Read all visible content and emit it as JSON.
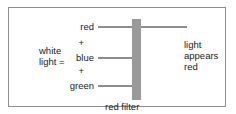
{
  "diagram": {
    "frame": {
      "border_color": "#8d8d8d",
      "background": "#ffffff"
    },
    "input": {
      "source_label_line1": "white",
      "source_label_line2": "light =",
      "components": [
        {
          "name": "red",
          "label": "red",
          "passes_filter": true
        },
        {
          "name": "blue",
          "label": "blue",
          "passes_filter": false
        },
        {
          "name": "green",
          "label": "green",
          "passes_filter": false
        }
      ],
      "separators": [
        "+",
        "+"
      ]
    },
    "filter": {
      "caption": "red filter",
      "color": "#9a9a9a"
    },
    "output": {
      "line1": "light",
      "line2": "appears",
      "line3": "red"
    },
    "ray_color": "#8d8d8d"
  }
}
